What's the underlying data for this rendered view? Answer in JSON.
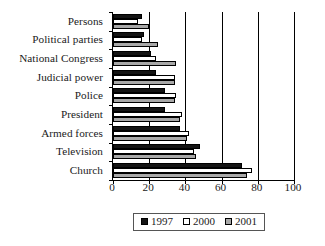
{
  "chart_data": {
    "type": "bar",
    "orientation": "horizontal",
    "title": "",
    "xlabel": "",
    "ylabel": "",
    "xlim": [
      0,
      100
    ],
    "xticks": [
      0,
      20,
      40,
      60,
      80,
      100
    ],
    "grid": true,
    "legend_position": "bottom",
    "categories": [
      "Persons",
      "Political parties",
      "National Congress",
      "Judicial power",
      "Police",
      "President",
      "Armed forces",
      "Television",
      "Church"
    ],
    "series": [
      {
        "name": "1997",
        "color": "#141414",
        "values": [
          16,
          17,
          21,
          24,
          29,
          29,
          37,
          48,
          71
        ]
      },
      {
        "name": "2000",
        "color": "#ffffff",
        "values": [
          14,
          16,
          24,
          34,
          35,
          38,
          42,
          45,
          77
        ]
      },
      {
        "name": "2001",
        "color": "#a8a8a8",
        "values": [
          20,
          25,
          35,
          34,
          34,
          37,
          41,
          46,
          74
        ]
      }
    ]
  },
  "legend": {
    "items": [
      {
        "label": "1997",
        "swatch": "black-square-icon"
      },
      {
        "label": "2000",
        "swatch": "white-square-icon"
      },
      {
        "label": "2001",
        "swatch": "gray-square-icon"
      }
    ]
  }
}
